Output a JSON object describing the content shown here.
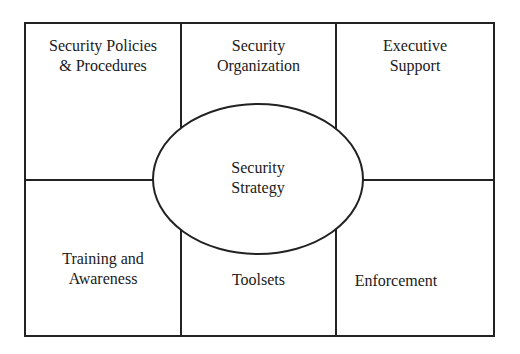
{
  "diagram": {
    "type": "grid-with-central-ellipse",
    "colors": {
      "line": "#222222",
      "text": "#1a1a1a",
      "background": "#ffffff"
    },
    "center": {
      "label": "Security\nStrategy"
    },
    "cells": [
      {
        "id": "security-policies-procedures",
        "label": "Security Policies\n& Procedures",
        "row": 1,
        "col": 1
      },
      {
        "id": "security-organization",
        "label": "Security\nOrganization",
        "row": 1,
        "col": 2
      },
      {
        "id": "executive-support",
        "label": "Executive\nSupport",
        "row": 1,
        "col": 3
      },
      {
        "id": "training-awareness",
        "label": "Training and\nAwareness",
        "row": 2,
        "col": 1
      },
      {
        "id": "toolsets",
        "label": "Toolsets",
        "row": 2,
        "col": 2
      },
      {
        "id": "enforcement",
        "label": "Enforcement",
        "row": 2,
        "col": 3
      }
    ]
  }
}
